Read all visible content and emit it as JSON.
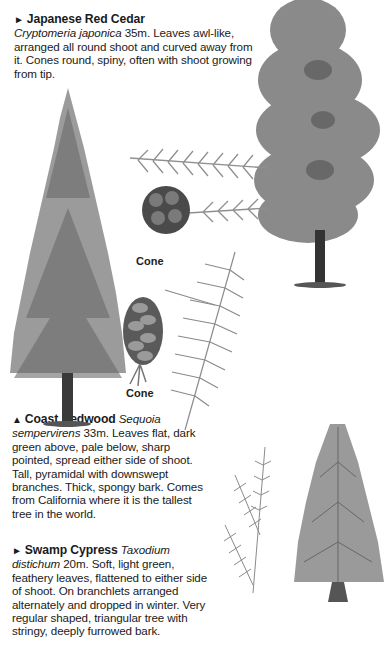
{
  "entries": [
    {
      "marker": "►",
      "common_name": "Japanese Red Cedar",
      "latin_name": "Cryptomeria japonica",
      "height": "35m.",
      "description": "Leaves awl-like, arranged all round shoot and curved away from it. Cones round, spiny, often with shoot growing from tip."
    },
    {
      "marker": "▲",
      "common_name": "Coast Redwood",
      "latin_name": "Sequoia sempervirens",
      "height": "33m.",
      "description": "Leaves flat, dark green above, pale below, sharp pointed, spread either side of shoot. Tall, pyramidal with downswept branches. Thick, spongy bark. Comes from California where it is the tallest tree in the world."
    },
    {
      "marker": "►",
      "common_name": "Swamp Cypress",
      "latin_name": "Taxodium distichum",
      "height": "20m.",
      "description": "Soft, light green, feathery leaves, flattened to either side of shoot. On branchlets arranged alternately and dropped in winter. Very regular shaped, triangular tree with stringy, deeply furrowed bark."
    }
  ],
  "captions": {
    "cedar_cone": "Cone",
    "redwood_cone": "Cone"
  },
  "illustrations": {
    "tree_fill": "#8a8a8a",
    "tree_dark": "#555555",
    "trunk": "#3a3a3a",
    "foliage_light": "#a8a8a8"
  }
}
